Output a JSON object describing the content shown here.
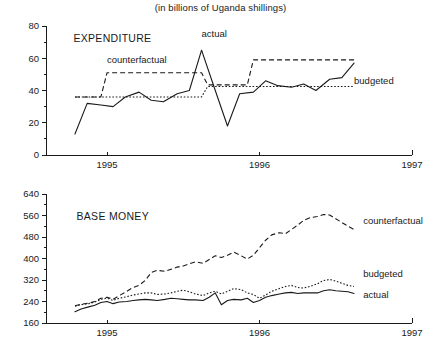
{
  "figure": {
    "title": "(in billions of Uganda shillings)",
    "colors": {
      "ink": "#1a1a1a",
      "background": "#ffffff"
    }
  },
  "chart_data": [
    {
      "type": "line",
      "panel_label": "EXPENDITURE",
      "title": "(in billions of Uganda shillings)",
      "xlabel": "",
      "ylabel": "",
      "xlim": [
        1994.6,
        1997.0
      ],
      "ylim": [
        0,
        80
      ],
      "grid": false,
      "legend_position": "inline-annotations",
      "xticks": [
        1995,
        1996,
        1997
      ],
      "xticklabels": [
        "1995",
        "1996",
        "1997"
      ],
      "yticks": [
        0,
        20,
        40,
        60,
        80
      ],
      "yticklabels": [
        "0",
        "20",
        "40",
        "60",
        "80"
      ],
      "yminorticks": [
        10,
        30,
        50,
        70
      ],
      "annotations": [
        {
          "text": "EXPENDITURE",
          "x": 1994.78,
          "y": 70
        },
        {
          "text": "counterfactual",
          "x": 1995.0,
          "y": 57
        },
        {
          "text": "actual",
          "x": 1995.62,
          "y": 73
        },
        {
          "text": "budgeted",
          "x": 1996.62,
          "y": 44
        }
      ],
      "series": [
        {
          "name": "actual",
          "style": "solid",
          "x": [
            1994.79,
            1994.87,
            1994.96,
            1995.04,
            1995.12,
            1995.21,
            1995.29,
            1995.37,
            1995.46,
            1995.54,
            1995.62,
            1995.71,
            1995.79,
            1995.87,
            1995.96,
            1996.04,
            1996.12,
            1996.21,
            1996.29,
            1996.37,
            1996.46,
            1996.54,
            1996.62
          ],
          "values": [
            13,
            32,
            31,
            30,
            36,
            39,
            34,
            33,
            38,
            40,
            65,
            40,
            18,
            38,
            39,
            46,
            43,
            42,
            44,
            40,
            47,
            48,
            57
          ]
        },
        {
          "name": "counterfactual",
          "style": "dashed",
          "x": [
            1994.79,
            1994.96,
            1995.0,
            1995.62,
            1995.66,
            1995.92,
            1995.96,
            1996.62
          ],
          "values": [
            36,
            36,
            51,
            51,
            43.5,
            43.5,
            59,
            59
          ]
        },
        {
          "name": "budgeted",
          "style": "dotted",
          "x": [
            1994.79,
            1995.62,
            1995.66,
            1996.62
          ],
          "values": [
            36,
            36,
            42.5,
            42.5
          ]
        }
      ]
    },
    {
      "type": "line",
      "panel_label": "BASE MONEY",
      "title": "",
      "xlabel": "",
      "ylabel": "",
      "xlim": [
        1994.6,
        1997.0
      ],
      "ylim": [
        160,
        640
      ],
      "grid": false,
      "legend_position": "right-inline",
      "xticks": [
        1995,
        1996,
        1997
      ],
      "xticklabels": [
        "1995",
        "1996",
        "1997"
      ],
      "yticks": [
        160,
        240,
        320,
        400,
        480,
        560,
        640
      ],
      "yticklabels": [
        "160",
        "240",
        "320",
        "400",
        "480",
        "560",
        "640"
      ],
      "yminorticks": [
        200,
        280,
        360,
        440,
        520,
        600
      ],
      "annotations": [
        {
          "text": "BASE MONEY",
          "x": 1994.8,
          "y": 545
        },
        {
          "text": "counterfactual",
          "x": 1996.68,
          "y": 530
        },
        {
          "text": "budgeted",
          "x": 1996.68,
          "y": 330
        },
        {
          "text": "actual",
          "x": 1996.68,
          "y": 252
        }
      ],
      "series": [
        {
          "name": "counterfactual",
          "style": "dashed",
          "x": [
            1994.79,
            1994.83,
            1994.88,
            1994.92,
            1994.96,
            1995.0,
            1995.04,
            1995.08,
            1995.13,
            1995.17,
            1995.21,
            1995.25,
            1995.29,
            1995.33,
            1995.38,
            1995.42,
            1995.46,
            1995.5,
            1995.54,
            1995.58,
            1995.63,
            1995.67,
            1995.71,
            1995.75,
            1995.79,
            1995.83,
            1995.88,
            1995.92,
            1995.96,
            1996.0,
            1996.04,
            1996.08,
            1996.13,
            1996.17,
            1996.21,
            1996.25,
            1996.29,
            1996.33,
            1996.38,
            1996.42,
            1996.46,
            1996.5,
            1996.54,
            1996.58,
            1996.62
          ],
          "values": [
            224,
            230,
            234,
            240,
            252,
            256,
            248,
            262,
            278,
            292,
            300,
            318,
            348,
            356,
            352,
            360,
            368,
            372,
            380,
            388,
            382,
            396,
            410,
            404,
            412,
            424,
            410,
            398,
            412,
            440,
            468,
            488,
            496,
            492,
            508,
            524,
            542,
            552,
            556,
            564,
            562,
            548,
            534,
            520,
            508
          ]
        },
        {
          "name": "budgeted",
          "style": "dotted",
          "x": [
            1994.79,
            1994.83,
            1994.88,
            1994.92,
            1994.96,
            1995.0,
            1995.04,
            1995.08,
            1995.13,
            1995.17,
            1995.21,
            1995.25,
            1995.29,
            1995.33,
            1995.38,
            1995.42,
            1995.46,
            1995.5,
            1995.54,
            1995.58,
            1995.63,
            1995.67,
            1995.71,
            1995.75,
            1995.79,
            1995.83,
            1995.88,
            1995.92,
            1995.96,
            1996.0,
            1996.04,
            1996.08,
            1996.13,
            1996.17,
            1996.21,
            1996.25,
            1996.29,
            1996.33,
            1996.38,
            1996.42,
            1996.46,
            1996.5,
            1996.54,
            1996.58,
            1996.62
          ],
          "values": [
            222,
            228,
            232,
            238,
            248,
            252,
            244,
            252,
            258,
            264,
            268,
            272,
            272,
            266,
            268,
            272,
            278,
            282,
            276,
            268,
            262,
            272,
            278,
            268,
            278,
            288,
            284,
            272,
            266,
            252,
            264,
            278,
            288,
            296,
            300,
            292,
            290,
            296,
            306,
            318,
            322,
            316,
            308,
            300,
            296
          ]
        },
        {
          "name": "actual",
          "style": "solid",
          "x": [
            1994.79,
            1994.83,
            1994.88,
            1994.92,
            1994.96,
            1995.0,
            1995.04,
            1995.08,
            1995.13,
            1995.17,
            1995.21,
            1995.25,
            1995.29,
            1995.33,
            1995.38,
            1995.42,
            1995.46,
            1995.5,
            1995.54,
            1995.58,
            1995.63,
            1995.67,
            1995.71,
            1995.75,
            1995.79,
            1995.83,
            1995.88,
            1995.92,
            1995.96,
            1996.0,
            1996.04,
            1996.08,
            1996.13,
            1996.17,
            1996.21,
            1996.25,
            1996.29,
            1996.33,
            1996.38,
            1996.42,
            1996.46,
            1996.5,
            1996.54,
            1996.58,
            1996.62
          ],
          "values": [
            202,
            212,
            220,
            226,
            236,
            240,
            232,
            238,
            240,
            244,
            246,
            248,
            246,
            244,
            248,
            252,
            250,
            248,
            246,
            246,
            244,
            256,
            272,
            228,
            244,
            248,
            246,
            252,
            236,
            244,
            256,
            262,
            268,
            272,
            274,
            270,
            272,
            272,
            272,
            280,
            284,
            280,
            278,
            276,
            270
          ]
        }
      ]
    }
  ]
}
